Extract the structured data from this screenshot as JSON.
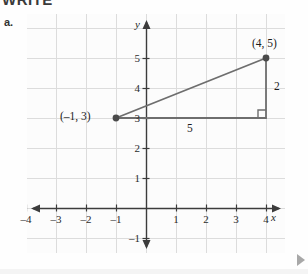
{
  "header": {
    "cut_text": "WRITE"
  },
  "problem": {
    "letter": "a."
  },
  "axes": {
    "x_letter": "x",
    "y_letter": "y",
    "x_tick_labels": [
      "–4",
      "–3",
      "–2",
      "–1",
      "1",
      "2",
      "3",
      "4"
    ],
    "x_tick_values": [
      -4,
      -3,
      -2,
      -1,
      1,
      2,
      3,
      4
    ],
    "y_tick_labels": [
      "–1",
      "1",
      "2",
      "3",
      "4",
      "5"
    ],
    "y_tick_values": [
      -1,
      1,
      2,
      3,
      4,
      5
    ]
  },
  "annotations": {
    "point_a_label": "(–1, 3)",
    "point_b_label": "(4, 5)",
    "run_label": "5",
    "rise_label": "2"
  },
  "chart_data": {
    "type": "scatter",
    "title": "",
    "xlabel": "x",
    "ylabel": "y",
    "xlim": [
      -4.6,
      4.6
    ],
    "ylim": [
      -1.6,
      5.9
    ],
    "grid": true,
    "legend": "none",
    "points": [
      {
        "label": "(–1, 3)",
        "x": -1,
        "y": 3
      },
      {
        "label": "(4, 5)",
        "x": 4,
        "y": 5
      }
    ],
    "segments": [
      {
        "name": "hypotenuse",
        "from": [
          -1,
          3
        ],
        "to": [
          4,
          5
        ]
      },
      {
        "name": "horizontal-leg",
        "from": [
          -1,
          3
        ],
        "to": [
          4,
          3
        ],
        "label": "5"
      },
      {
        "name": "vertical-leg",
        "from": [
          4,
          3
        ],
        "to": [
          4,
          5
        ],
        "label": "2"
      }
    ],
    "right_angle_vertex": [
      4,
      3
    ],
    "colors": {
      "grid": "#dcdcdc",
      "axis": "#3c3c3c",
      "segment": "#6e6e6e",
      "point": "#4a4a4a"
    }
  }
}
